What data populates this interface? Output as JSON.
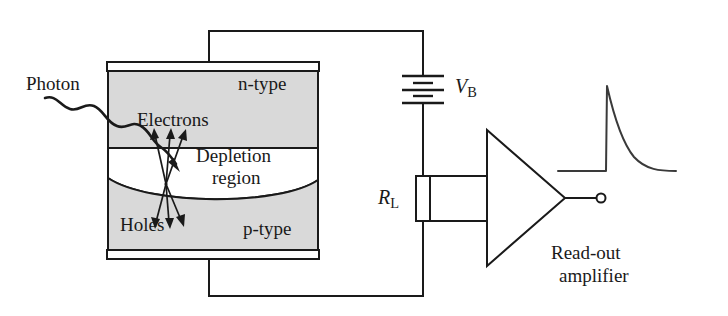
{
  "figure": {
    "colors": {
      "line": "#1a1a1a",
      "semiconductor_fill": "#d9d9d9",
      "depletion_fill": "#ffffff",
      "background": "#ffffff"
    }
  },
  "labels": {
    "photon": "Photon",
    "n_type": "n-type",
    "electrons": "Electrons",
    "depletion_line1": "Depletion",
    "depletion_line2": "region",
    "holes": "Holes",
    "p_type": "p-type",
    "bias_voltage": "V",
    "bias_voltage_sub": "B",
    "load_resistor": "R",
    "load_resistor_sub": "L",
    "amplifier_line1": "Read-out",
    "amplifier_line2": "amplifier"
  },
  "components": {
    "device": {
      "name": "photodiode",
      "top_contact": "n-side metal contact",
      "bottom_contact": "p-side metal contact",
      "layers": [
        "n-type",
        "Depletion region",
        "p-type"
      ]
    },
    "battery": {
      "name": "bias battery",
      "plates": 6,
      "label": "V_B"
    },
    "resistor": {
      "name": "load resistor",
      "label": "R_L"
    },
    "amplifier": {
      "name": "read-out amplifier",
      "shape": "triangle",
      "inputs": 2,
      "output_terminal": "open circle"
    },
    "carriers": {
      "electron_arrows": 3,
      "hole_arrows": 3,
      "electron_direction": "up toward n-type",
      "hole_direction": "down toward p-type"
    },
    "photon_ray": {
      "name": "incident photon",
      "style": "wavy arrow",
      "direction": "from upper left into depletion region"
    },
    "waveform": {
      "name": "output pulse",
      "shape": "fast rise, exponential decay",
      "baseline": "flat"
    }
  }
}
